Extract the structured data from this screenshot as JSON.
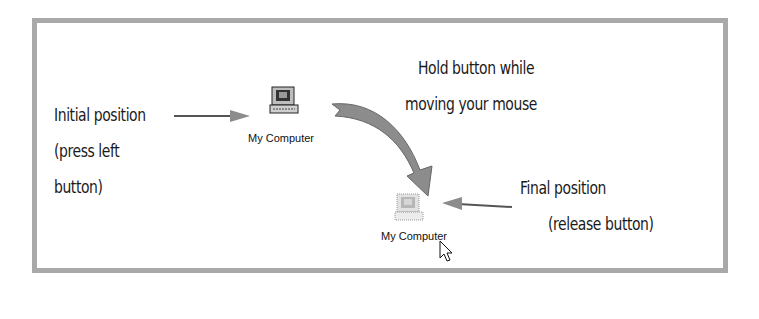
{
  "labels": {
    "initial_line1": "Initial position",
    "initial_line2": "(press left",
    "initial_line3": "button)",
    "hold_line1": "Hold button while",
    "hold_line2": "moving your mouse",
    "final_line1": "Final position",
    "final_line2": "(release button)"
  },
  "icons": {
    "initial": {
      "caption": "My Computer"
    },
    "final": {
      "caption": "My Computer"
    }
  },
  "colors": {
    "frame": "#a9a9a9",
    "arrow": "#8c8c8c",
    "text": "#1a1a1a"
  }
}
